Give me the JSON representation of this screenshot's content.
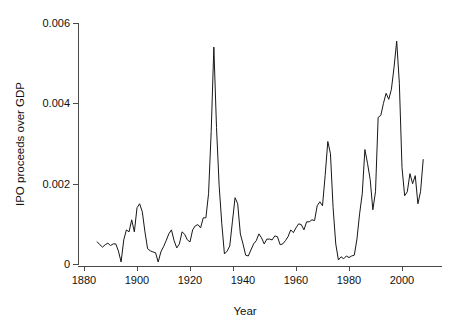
{
  "chart_data": {
    "type": "line",
    "title": "",
    "xlabel": "Year",
    "ylabel": "IPO proceeds over GDP",
    "xlim": [
      1876,
      2012
    ],
    "ylim": [
      0,
      0.006
    ],
    "grid": false,
    "legend": null,
    "xticks": [
      1880,
      1900,
      1920,
      1940,
      1960,
      1980,
      2000
    ],
    "xtick_labels": [
      "1880",
      "1900",
      "1920",
      "1940",
      "1960",
      "1980",
      "2000"
    ],
    "yticks": [
      0,
      0.002,
      0.004,
      0.006
    ],
    "ytick_labels": [
      "0",
      "0.002",
      "0.004",
      "0.006"
    ],
    "series": [
      {
        "name": "IPO proceeds over GDP",
        "color": "#171717",
        "x": [
          1885,
          1886,
          1887,
          1888,
          1889,
          1890,
          1891,
          1892,
          1893,
          1894,
          1895,
          1896,
          1897,
          1898,
          1899,
          1900,
          1901,
          1902,
          1903,
          1904,
          1905,
          1906,
          1907,
          1908,
          1909,
          1910,
          1911,
          1912,
          1913,
          1914,
          1915,
          1916,
          1917,
          1918,
          1919,
          1920,
          1921,
          1922,
          1923,
          1924,
          1925,
          1926,
          1927,
          1928,
          1929,
          1930,
          1931,
          1932,
          1933,
          1934,
          1935,
          1936,
          1937,
          1938,
          1939,
          1940,
          1941,
          1942,
          1943,
          1944,
          1945,
          1946,
          1947,
          1948,
          1949,
          1950,
          1951,
          1952,
          1953,
          1954,
          1955,
          1956,
          1957,
          1958,
          1959,
          1960,
          1961,
          1962,
          1963,
          1964,
          1965,
          1966,
          1967,
          1968,
          1969,
          1970,
          1971,
          1972,
          1973,
          1974,
          1975,
          1976,
          1977,
          1978,
          1979,
          1980,
          1981,
          1982,
          1983,
          1984,
          1985,
          1986,
          1987,
          1988,
          1989,
          1990,
          1991,
          1992,
          1993,
          1994,
          1995,
          1996,
          1997,
          1998,
          1999,
          2000,
          2001,
          2002,
          2003,
          2004,
          2005,
          2006,
          2007,
          2008
        ],
        "y": [
          0.00055,
          0.00048,
          0.00042,
          0.00048,
          0.00052,
          0.00046,
          0.0005,
          0.0005,
          0.00032,
          5e-05,
          0.0006,
          0.00085,
          0.0008,
          0.0011,
          0.0008,
          0.0014,
          0.0015,
          0.0013,
          0.0008,
          0.00038,
          0.00033,
          0.0003,
          0.00028,
          5e-05,
          0.0003,
          0.00043,
          0.00058,
          0.00075,
          0.00085,
          0.00058,
          0.0004,
          0.0005,
          0.0008,
          0.00074,
          0.0006,
          0.00055,
          0.00085,
          0.00095,
          0.00098,
          0.0009,
          0.00115,
          0.00115,
          0.00175,
          0.0033,
          0.0054,
          0.0034,
          0.00195,
          0.001,
          0.00025,
          0.00032,
          0.00045,
          0.00105,
          0.00165,
          0.0015,
          0.00075,
          0.0005,
          0.00022,
          0.0002,
          0.00035,
          0.0005,
          0.00058,
          0.00075,
          0.00065,
          0.0005,
          0.00062,
          0.00062,
          0.0006,
          0.0007,
          0.00068,
          0.00048,
          0.0005,
          0.00058,
          0.00068,
          0.00085,
          0.00078,
          0.0009,
          0.001,
          0.00098,
          0.00085,
          0.00105,
          0.00105,
          0.0011,
          0.00108,
          0.00145,
          0.00155,
          0.00145,
          0.0022,
          0.00305,
          0.00275,
          0.0014,
          0.0005,
          0.0001,
          0.00018,
          0.00013,
          0.0002,
          0.00016,
          0.0002,
          0.00022,
          0.00062,
          0.00125,
          0.00175,
          0.00285,
          0.0025,
          0.0021,
          0.00135,
          0.0018,
          0.00365,
          0.0037,
          0.004,
          0.00425,
          0.0041,
          0.00435,
          0.0049,
          0.00555,
          0.0045,
          0.0024,
          0.0017,
          0.0018,
          0.00225,
          0.002,
          0.0022,
          0.0015,
          0.0018,
          0.0026
        ]
      }
    ],
    "peaks": [
      {
        "year": 1929,
        "value": 0.0054
      },
      {
        "year": 1999,
        "value": 0.00555
      },
      {
        "year": 1968,
        "value": 0.00305
      },
      {
        "year": 1984,
        "value": 0.00285
      }
    ]
  }
}
